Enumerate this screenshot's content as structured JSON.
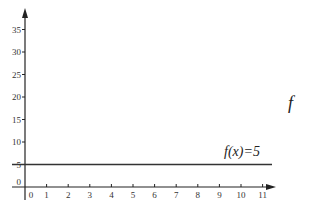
{
  "chart_data": {
    "type": "line",
    "title": "",
    "xlabel": "",
    "ylabel": "",
    "xlim": [
      0,
      11
    ],
    "ylim": [
      0,
      35
    ],
    "grid": false,
    "legend": null,
    "x_ticks": [
      "0",
      "1",
      "2",
      "3",
      "4",
      "5",
      "6",
      "7",
      "8",
      "9",
      "10",
      "11"
    ],
    "y_ticks": [
      "0",
      "5",
      "10",
      "15",
      "20",
      "25",
      "30",
      "35"
    ],
    "series": [
      {
        "name": "f(x)=5",
        "x": [
          0,
          11
        ],
        "values": [
          5,
          5
        ]
      }
    ],
    "annotations": [
      {
        "text": "f(x)=5",
        "x": 10,
        "y": 5
      },
      {
        "text": "f",
        "position": "right-margin"
      }
    ]
  },
  "labels": {
    "function_label": "f(x)=5",
    "side_label": "f"
  },
  "colors": {
    "axis": "#222222",
    "line": "#333333",
    "text": "#333333"
  }
}
